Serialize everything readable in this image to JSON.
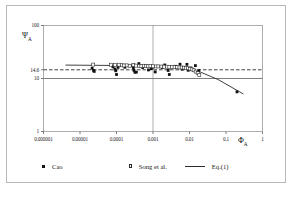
{
  "figure": {
    "name": "psi-a-vs-phi-a-log-log-plot",
    "background": "#ffffff",
    "border_color": "#b9b9b9"
  },
  "axes": {
    "x_title": "Φ",
    "x_title_sub": "A",
    "y_title": "Ψ",
    "y_title_sub": "A",
    "x_ticks": [
      "0.000001",
      "0.00001",
      "0.0001",
      "0.001",
      "0.01",
      "0.1",
      "1"
    ],
    "y_ticks": [
      "100",
      "14.6",
      "10",
      "1"
    ]
  },
  "legend": {
    "items": [
      {
        "label": "Cao",
        "marker": "filled-square",
        "name": "legend-item-cao"
      },
      {
        "label": "Song et al.",
        "marker": "open-square",
        "name": "legend-item-song"
      },
      {
        "label": "Eq.(1)",
        "marker": "line",
        "name": "legend-item-eq1"
      }
    ]
  },
  "chart_data": {
    "type": "scatter",
    "title": "",
    "xlabel": "Φ_A",
    "ylabel": "Ψ_A",
    "xscale": "log",
    "yscale": "log",
    "xlim": [
      1e-06,
      1
    ],
    "ylim": [
      1,
      100
    ],
    "grid": true,
    "gridlines": {
      "vertical_x": [
        0.001
      ],
      "horizontal_y": [
        10
      ],
      "dashed_horizontal_y": [
        14.6
      ]
    },
    "legend_position": "below-axes",
    "reference_lines": [
      {
        "name": "psi-14.6-dashed",
        "y": 14.6,
        "style": "dashed",
        "color": "#2b2b2b",
        "x_from": 1e-06,
        "x_to": 1
      },
      {
        "name": "psi-10-solid",
        "y": 10,
        "style": "solid",
        "color": "#6f6f6f",
        "x_from": 1e-06,
        "x_to": 1
      }
    ],
    "series": [
      {
        "name": "Eq.(1)",
        "type": "line",
        "color": "#2b2b2b",
        "points": [
          [
            4e-06,
            17.9
          ],
          [
            0.0001,
            17.6
          ],
          [
            0.001,
            17.2
          ],
          [
            0.005,
            16.4
          ],
          [
            0.012,
            15.2
          ],
          [
            0.02,
            13.2
          ],
          [
            0.06,
            9.6
          ],
          [
            0.3,
            5.1
          ]
        ]
      },
      {
        "name": "Cao",
        "type": "scatter",
        "marker": "filled-square",
        "color": "#111111",
        "points": [
          [
            2.15e-05,
            15.6
          ],
          [
            2.35e-05,
            14.2
          ],
          [
            2.45e-05,
            13.6
          ],
          [
            8e-05,
            16.6
          ],
          [
            9e-05,
            15.1
          ],
          [
            9.5e-05,
            14.0
          ],
          [
            0.0001,
            11.9
          ],
          [
            0.00011,
            16.2
          ],
          [
            0.00017,
            16.3
          ],
          [
            0.00026,
            17.4
          ],
          [
            0.00029,
            16.1
          ],
          [
            0.0003,
            14.3
          ],
          [
            0.00032,
            13.1
          ],
          [
            0.00035,
            13.2
          ],
          [
            0.00041,
            19.1
          ],
          [
            0.00045,
            17.2
          ],
          [
            0.00052,
            16.1
          ],
          [
            0.00075,
            14.5
          ],
          [
            0.0009,
            15.3
          ],
          [
            0.00098,
            16.4
          ],
          [
            0.00115,
            13.3
          ],
          [
            0.0018,
            16.1
          ],
          [
            0.0021,
            18.0
          ],
          [
            0.0026,
            14.2
          ],
          [
            0.0028,
            11.9
          ],
          [
            0.0042,
            17.0
          ],
          [
            0.0055,
            18.6
          ],
          [
            0.0063,
            15.0
          ],
          [
            0.0085,
            18.5
          ],
          [
            0.0092,
            14.3
          ],
          [
            0.011,
            15.8
          ],
          [
            0.0125,
            14.6
          ],
          [
            0.0145,
            17.5
          ],
          [
            0.018,
            14.1
          ],
          [
            0.2,
            5.6
          ]
        ]
      },
      {
        "name": "Song et al.",
        "type": "scatter",
        "marker": "open-square",
        "color": "#2a2a2a",
        "points": [
          [
            2.3e-05,
            18.3
          ],
          [
            7e-05,
            18.2
          ],
          [
            9e-05,
            18.0
          ],
          [
            0.000115,
            18.2
          ],
          [
            0.00014,
            17.8
          ],
          [
            0.00016,
            17.6
          ],
          [
            0.00019,
            17.7
          ],
          [
            0.00023,
            17.4
          ],
          [
            0.00029,
            18.0
          ],
          [
            0.00034,
            17.5
          ],
          [
            0.00042,
            17.3
          ],
          [
            0.00048,
            17.1
          ],
          [
            0.00056,
            17.4
          ],
          [
            0.00064,
            17.2
          ],
          [
            0.00072,
            17.0
          ],
          [
            0.00085,
            17.1
          ],
          [
            0.001,
            17.0
          ],
          [
            0.0012,
            16.9
          ],
          [
            0.0014,
            16.9
          ],
          [
            0.0017,
            16.8
          ],
          [
            0.002,
            16.7
          ],
          [
            0.0024,
            16.7
          ],
          [
            0.0028,
            16.6
          ],
          [
            0.0033,
            16.5
          ],
          [
            0.0039,
            16.4
          ],
          [
            0.0046,
            16.3
          ],
          [
            0.0053,
            16.2
          ],
          [
            0.0061,
            16.1
          ],
          [
            0.007,
            16.0
          ],
          [
            0.008,
            15.8
          ],
          [
            0.009,
            15.6
          ],
          [
            0.0102,
            15.3
          ],
          [
            0.0115,
            14.9
          ],
          [
            0.013,
            14.3
          ],
          [
            0.0148,
            13.5
          ],
          [
            0.0168,
            12.6
          ],
          [
            0.0185,
            11.6
          ]
        ]
      }
    ]
  }
}
